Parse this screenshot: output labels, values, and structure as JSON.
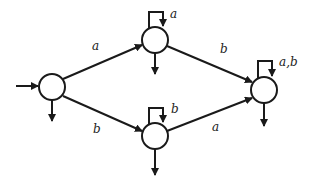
{
  "diagram": {
    "type": "finite-state-automaton",
    "colors": {
      "stroke": "#1a1a1a",
      "node_fill": "#ffffff",
      "label": "#222222"
    },
    "states": [
      {
        "id": "q0",
        "x": 52,
        "y": 87,
        "initial": true,
        "accepting_arrow": true
      },
      {
        "id": "q1",
        "x": 155,
        "y": 40,
        "accepting_arrow": true
      },
      {
        "id": "q2",
        "x": 155,
        "y": 136,
        "accepting_arrow": true
      },
      {
        "id": "q3",
        "x": 264,
        "y": 90,
        "accepting_arrow": true
      }
    ],
    "transitions": [
      {
        "from": "q0",
        "to": "q1",
        "label": "a"
      },
      {
        "from": "q0",
        "to": "q2",
        "label": "b"
      },
      {
        "from": "q1",
        "to": "q1",
        "label": "a"
      },
      {
        "from": "q2",
        "to": "q2",
        "label": "b"
      },
      {
        "from": "q1",
        "to": "q3",
        "label": "b"
      },
      {
        "from": "q2",
        "to": "q3",
        "label": "a"
      },
      {
        "from": "q3",
        "to": "q3",
        "label": "a,b"
      }
    ],
    "labels": {
      "q0_q1": "a",
      "q0_q2": "b",
      "q1_loop": "a",
      "q2_loop": "b",
      "q1_q3": "b",
      "q2_q3": "a",
      "q3_loop": "a,b"
    }
  }
}
